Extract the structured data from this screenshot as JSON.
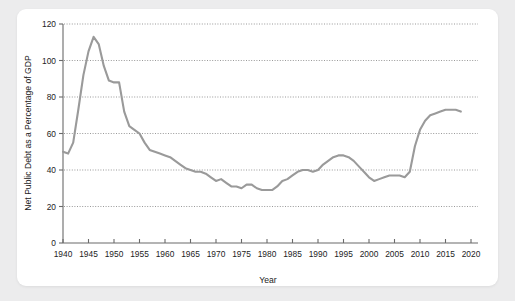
{
  "chart_data": {
    "type": "line",
    "title": "",
    "xlabel": "Year",
    "ylabel": "Net Public Debt as a Percentage of GDP",
    "xlim": [
      1940,
      2020
    ],
    "ylim": [
      0,
      120
    ],
    "grid": "horizontal-dotted",
    "legend": "none",
    "line_color": "#9a9a9a",
    "xticks": [
      1940,
      1945,
      1950,
      1955,
      1960,
      1965,
      1970,
      1975,
      1980,
      1985,
      1990,
      1995,
      2000,
      2005,
      2010,
      2015,
      2020
    ],
    "yticks": [
      0,
      20,
      40,
      60,
      80,
      100,
      120
    ],
    "series": [
      {
        "name": "Net Public Debt as a Percentage of GDP",
        "x": [
          1940,
          1941,
          1942,
          1943,
          1944,
          1945,
          1946,
          1947,
          1948,
          1949,
          1950,
          1951,
          1952,
          1953,
          1954,
          1955,
          1956,
          1957,
          1958,
          1959,
          1960,
          1961,
          1962,
          1963,
          1964,
          1965,
          1966,
          1967,
          1968,
          1969,
          1970,
          1971,
          1972,
          1973,
          1974,
          1975,
          1976,
          1977,
          1978,
          1979,
          1980,
          1981,
          1982,
          1983,
          1984,
          1985,
          1986,
          1987,
          1988,
          1989,
          1990,
          1991,
          1992,
          1993,
          1994,
          1995,
          1996,
          1997,
          1998,
          1999,
          2000,
          2001,
          2002,
          2003,
          2004,
          2005,
          2006,
          2007,
          2008,
          2009,
          2010,
          2011,
          2012,
          2013,
          2014,
          2015,
          2016,
          2017,
          2018
        ],
        "values": [
          50,
          49,
          55,
          73,
          92,
          105,
          113,
          109,
          97,
          89,
          88,
          88,
          72,
          64,
          62,
          60,
          55,
          51,
          50,
          49,
          48,
          47,
          45,
          43,
          41,
          40,
          39,
          39,
          38,
          36,
          34,
          35,
          33,
          31,
          31,
          30,
          32,
          32,
          30,
          29,
          29,
          29,
          31,
          34,
          35,
          37,
          39,
          40,
          40,
          39,
          40,
          43,
          45,
          47,
          48,
          48,
          47,
          45,
          42,
          39,
          36,
          34,
          35,
          36,
          37,
          37,
          37,
          36,
          39,
          53,
          62,
          67,
          70,
          71,
          72,
          73,
          73,
          73,
          72
        ]
      }
    ]
  }
}
